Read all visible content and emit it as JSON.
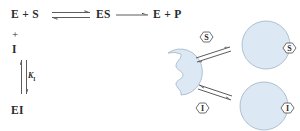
{
  "figure": {
    "background_color": "#ffffff",
    "enzyme_fill": "#dce8f3",
    "enzyme_stroke": "#9fb4c6",
    "text_color": "#2b2b2b",
    "arrow_color": "#4a4a4a"
  },
  "scheme": {
    "free_enzyme_substrate": "E + S",
    "enzyme_substrate_complex": "ES",
    "products": "E + P",
    "plus_sign": "+",
    "inhibitor": "I",
    "enzyme_inhibitor_complex": "EI",
    "dissociation_constant": "K",
    "dissociation_constant_subscript": "I"
  },
  "diagram": {
    "free_enzyme_label": "free-enzyme",
    "substrate_ligand": "S",
    "inhibitor_ligand": "I",
    "substrate_complex_label": "ES",
    "inhibitor_complex_label": "EI"
  }
}
